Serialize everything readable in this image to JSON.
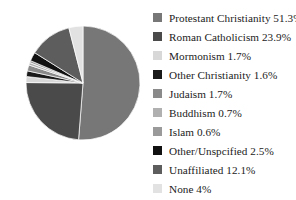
{
  "chart_data": {
    "type": "pie",
    "title": "",
    "subtitle": "",
    "xlabel": "",
    "ylabel": "",
    "legend_position": "right",
    "grid": false,
    "start_angle_deg": 0,
    "direction": "clockwise",
    "categories": [
      "Protestant Christianity",
      "Roman Catholicism",
      "Mormonism",
      "Other Christianity",
      "Judaism",
      "Buddhism",
      "Islam",
      "Other/Unspcified",
      "Unaffiliated",
      "None"
    ],
    "values": [
      51.3,
      23.9,
      1.7,
      1.6,
      1.7,
      0.7,
      0.6,
      2.5,
      12.1,
      4
    ],
    "value_suffix": "%",
    "colors": [
      "#777777",
      "#4a4a4a",
      "#d8d8d8",
      "#1a1a1a",
      "#8a8a8a",
      "#b0b0b0",
      "#9a9a9a",
      "#111111",
      "#5d5d5d",
      "#e2e2e2"
    ],
    "legend_entries": [
      {
        "label": "Protestant Christianity 51.3%",
        "color": "#777777"
      },
      {
        "label": "Roman Catholicism 23.9%",
        "color": "#4a4a4a"
      },
      {
        "label": "Mormonism 1.7%",
        "color": "#d8d8d8"
      },
      {
        "label": "Other Christianity 1.6%",
        "color": "#1a1a1a"
      },
      {
        "label": "Judaism 1.7%",
        "color": "#8a8a8a"
      },
      {
        "label": "Buddhism 0.7%",
        "color": "#b0b0b0"
      },
      {
        "label": "Islam 0.6%",
        "color": "#9a9a9a"
      },
      {
        "label": "Other/Unspcified 2.5%",
        "color": "#111111"
      },
      {
        "label": "Unaffiliated 12.1%",
        "color": "#5d5d5d"
      },
      {
        "label": "None 4%",
        "color": "#e2e2e2"
      }
    ]
  }
}
